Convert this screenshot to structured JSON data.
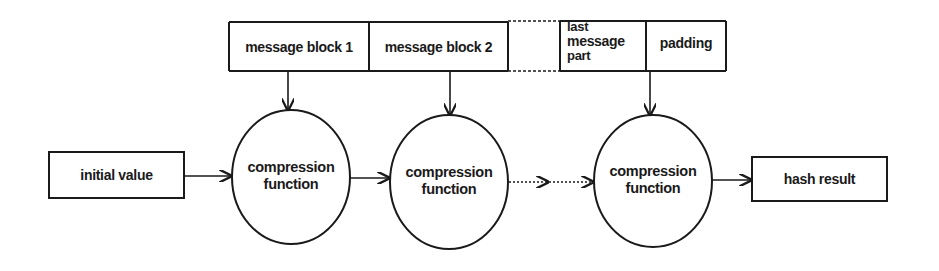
{
  "diagram": {
    "message": {
      "blocks": [
        {
          "label": "message block 1"
        },
        {
          "label": "message block 2"
        },
        {
          "label": ""
        },
        {
          "label_lines": [
            "last",
            "message",
            "part"
          ]
        },
        {
          "label": "padding"
        }
      ]
    },
    "initial_value": {
      "label": "initial value"
    },
    "compression_functions": [
      {
        "line1": "compression",
        "line2": "function"
      },
      {
        "line1": "compression",
        "line2": "function"
      },
      {
        "line1": "compression",
        "line2": "function"
      }
    ],
    "hash_result": {
      "label": "hash result"
    },
    "colors": {
      "stroke": "#1a1a1a",
      "background": "#ffffff"
    }
  }
}
